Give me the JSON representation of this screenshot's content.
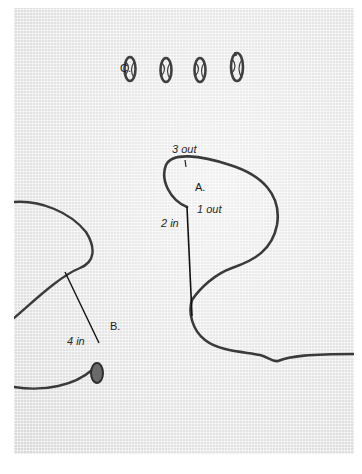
{
  "figure": {
    "labels": {
      "c": "C.",
      "a": "A.",
      "b": "B.",
      "three_out": "3 out",
      "one_out": "1 out",
      "two_in": "2 in",
      "four_in": "4 in"
    },
    "colors": {
      "fabric": "#e9e9e9",
      "thread": "#3a3a3a",
      "needle": "#111111",
      "background": "#ffffff"
    },
    "stitch_count_row_c": 4
  }
}
